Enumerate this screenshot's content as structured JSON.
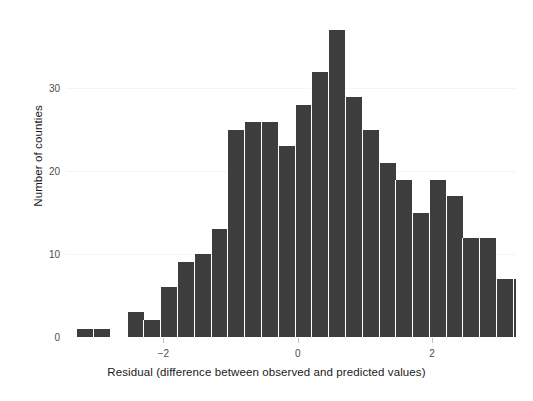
{
  "chart_data": {
    "type": "bar",
    "subtype": "histogram",
    "title": "",
    "xlabel": "Residual (difference between observed and predicted values)",
    "ylabel": "Number of counties",
    "xlim": [
      -3.45,
      3.25
    ],
    "ylim": [
      0,
      38.5
    ],
    "xticks": [
      -2,
      0,
      2
    ],
    "xticklabels": [
      "−2",
      "0",
      "2"
    ],
    "yticks": [
      0,
      10,
      20,
      30
    ],
    "yticklabels": [
      "0",
      "10",
      "20",
      "30"
    ],
    "grid": "horizontal-light",
    "legend": "none",
    "bar_color": "#3d3d3d",
    "bin_width": 0.2539,
    "bin_left_edges": [
      -3.3,
      -3.05,
      -2.55,
      -2.3,
      -2.05,
      -1.8,
      -1.55,
      -1.3,
      -1.05,
      -0.8,
      -0.55,
      -0.3,
      -0.05,
      0.2,
      0.45,
      0.7,
      0.95,
      1.2,
      1.45,
      1.7,
      1.95,
      2.2,
      2.45,
      2.7,
      2.95
    ],
    "bin_centers": [
      -3.17,
      -2.92,
      -2.42,
      -2.17,
      -1.92,
      -1.67,
      -1.42,
      -1.17,
      -0.92,
      -0.67,
      -0.42,
      -0.17,
      0.08,
      0.33,
      0.58,
      0.83,
      1.08,
      1.33,
      1.58,
      1.83,
      2.08,
      2.33,
      2.58,
      2.83,
      3.08
    ],
    "values": [
      1,
      1,
      3,
      2,
      6,
      9,
      10,
      13,
      25,
      26,
      26,
      23,
      28,
      32,
      37,
      29,
      25,
      21,
      19,
      15,
      19,
      17,
      12,
      12,
      7
    ],
    "bars": [
      {
        "center": -3.17,
        "value": 1
      },
      {
        "center": -2.92,
        "value": 1
      },
      {
        "center": -2.42,
        "value": 3
      },
      {
        "center": -2.17,
        "value": 2
      },
      {
        "center": -1.92,
        "value": 6
      },
      {
        "center": -1.67,
        "value": 9
      },
      {
        "center": -1.42,
        "value": 10
      },
      {
        "center": -1.17,
        "value": 13
      },
      {
        "center": -0.92,
        "value": 25
      },
      {
        "center": -0.67,
        "value": 26
      },
      {
        "center": -0.42,
        "value": 26
      },
      {
        "center": -0.17,
        "value": 23
      },
      {
        "center": 0.08,
        "value": 28
      },
      {
        "center": 0.33,
        "value": 32
      },
      {
        "center": 0.58,
        "value": 37
      },
      {
        "center": 0.83,
        "value": 29
      },
      {
        "center": 1.08,
        "value": 25
      },
      {
        "center": 1.33,
        "value": 21
      },
      {
        "center": 1.58,
        "value": 19
      },
      {
        "center": 1.83,
        "value": 15
      },
      {
        "center": 2.08,
        "value": 19
      },
      {
        "center": 2.33,
        "value": 17
      },
      {
        "center": 2.58,
        "value": 12
      },
      {
        "center": 2.83,
        "value": 12
      },
      {
        "center": 3.08,
        "value": 7
      },
      {
        "center": 3.33,
        "value": 7
      },
      {
        "center": 3.58,
        "value": 2
      },
      {
        "center": 3.83,
        "value": 2
      },
      {
        "center": 4.08,
        "value": 1
      }
    ]
  }
}
